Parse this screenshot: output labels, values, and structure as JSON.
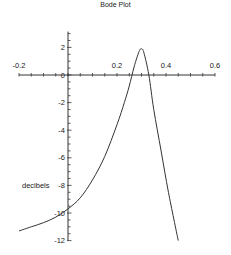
{
  "chart_data": {
    "type": "line",
    "title": "Bode Plot",
    "xlabel": "",
    "ylabel": "decibels",
    "xlim": [
      -0.2,
      0.6
    ],
    "ylim": [
      -12,
      3
    ],
    "grid": false,
    "legend": null,
    "x_ticks": [
      -0.2,
      0.2,
      0.4,
      0.6
    ],
    "x_tick_labels": [
      "-0.2",
      "0.2",
      "0.4",
      "0.6"
    ],
    "y_ticks": [
      2,
      0,
      -2,
      -4,
      -6,
      -8,
      -10,
      -12
    ],
    "y_tick_labels": [
      "2",
      "0",
      "-2",
      "-4",
      "-6",
      "-8",
      "-10",
      "-12"
    ],
    "series": [
      {
        "name": "gain",
        "x": [
          -0.2,
          -0.15,
          -0.1,
          -0.05,
          0.0,
          0.05,
          0.1,
          0.15,
          0.2,
          0.23,
          0.25,
          0.27,
          0.29,
          0.3,
          0.31,
          0.33,
          0.35,
          0.38,
          0.41,
          0.45
        ],
        "y": [
          -11.3,
          -11.0,
          -10.7,
          -10.3,
          -9.7,
          -8.9,
          -7.6,
          -5.9,
          -3.6,
          -2.0,
          -0.8,
          0.6,
          1.7,
          1.9,
          1.6,
          0.0,
          -2.5,
          -5.5,
          -8.5,
          -12.0
        ]
      }
    ]
  }
}
